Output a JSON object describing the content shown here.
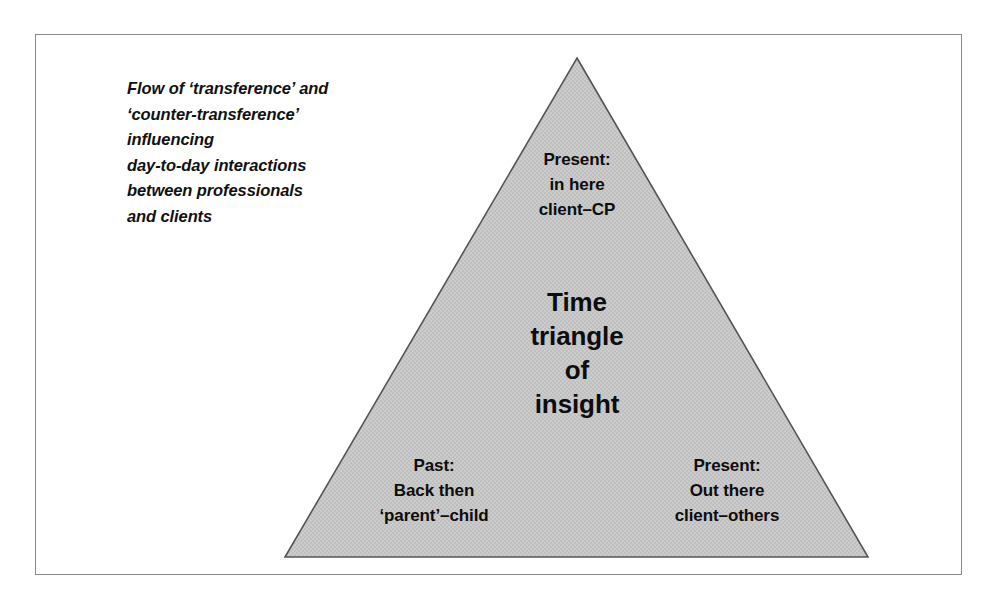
{
  "figure": {
    "name": "time-triangle-of-insight",
    "background_color": "#ffffff",
    "frame_border_color": "#8a8a8a",
    "triangle_fill_color": "#c8c8c8",
    "triangle_stroke_color": "#555555",
    "text_color": "#0d0d0d"
  },
  "caption": {
    "lines": [
      "Flow of ‘transference’ and",
      "‘counter-transference’",
      "influencing",
      "day-to-day interactions",
      "between professionals",
      "and clients"
    ]
  },
  "triangle": {
    "apex_label": {
      "lines": [
        "Present:",
        "in here",
        "client–CP"
      ]
    },
    "center_label": {
      "lines": [
        "Time",
        "triangle",
        "of",
        "insight"
      ]
    },
    "bottom_left_label": {
      "lines": [
        "Past:",
        "Back then",
        "‘parent’–child"
      ]
    },
    "bottom_right_label": {
      "lines": [
        "Present:",
        "Out there",
        "client–others"
      ]
    }
  }
}
